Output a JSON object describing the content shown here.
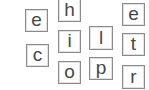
{
  "puzzle": {
    "tiles": [
      {
        "letter": "e",
        "x": 25,
        "y": 9,
        "w": 23,
        "h": 23
      },
      {
        "letter": "h",
        "x": 58,
        "y": -2,
        "w": 23,
        "h": 24
      },
      {
        "letter": "i",
        "x": 58,
        "y": 30,
        "w": 23,
        "h": 23
      },
      {
        "letter": "c",
        "x": 26,
        "y": 44,
        "w": 23,
        "h": 23
      },
      {
        "letter": "o",
        "x": 58,
        "y": 61,
        "w": 23,
        "h": 23
      },
      {
        "letter": "l",
        "x": 89,
        "y": 26,
        "w": 24,
        "h": 24
      },
      {
        "letter": "p",
        "x": 89,
        "y": 57,
        "w": 24,
        "h": 23
      },
      {
        "letter": "e",
        "x": 122,
        "y": 3,
        "w": 23,
        "h": 23
      },
      {
        "letter": "t",
        "x": 122,
        "y": 33,
        "w": 23,
        "h": 23
      },
      {
        "letter": "r",
        "x": 122,
        "y": 65,
        "w": 23,
        "h": 24
      }
    ]
  },
  "colors": {
    "border": "#8a8a8a",
    "letter": "#474747",
    "background": "#ffffff"
  }
}
